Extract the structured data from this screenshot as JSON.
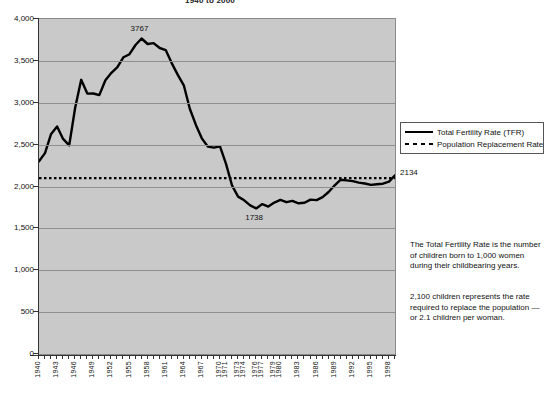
{
  "title": "1940 to 2000",
  "legend": {
    "items": [
      {
        "label": "Total Fertility Rate (TFR)",
        "style": "solid",
        "color": "#000000"
      },
      {
        "label": "Population Replacement Rate",
        "style": "dashed",
        "color": "#000000"
      }
    ]
  },
  "notes": {
    "note1": "The Total Fertility Rate is the number of children born to 1,000 women during their childbearing years.",
    "note2": "2,100 children represents the rate required to replace the population — or 2.1 children per woman."
  },
  "labels": {
    "peak": "3767",
    "trough": "1738",
    "end": "2134"
  },
  "chart_data": {
    "type": "line",
    "title": "1940 to 2000",
    "xlabel": "",
    "ylabel": "",
    "ylim": [
      0,
      4000
    ],
    "yticks": [
      0,
      500,
      1000,
      1500,
      2000,
      2500,
      3000,
      3500,
      4000
    ],
    "ytick_labels": [
      "0",
      "500",
      "1,000",
      "1,500",
      "2,000",
      "2,500",
      "3,000",
      "3,500",
      "4,000"
    ],
    "xlim": [
      1940,
      1999
    ],
    "xtick_labels": [
      "1940",
      "1943",
      "1946",
      "1949",
      "1952",
      "1955",
      "1958",
      "1961",
      "1964",
      "1967",
      "1970",
      "1971",
      "1973",
      "1974",
      "1976",
      "1977",
      "1979",
      "1980",
      "1983",
      "1986",
      "1989",
      "1992",
      "1995",
      "1998"
    ],
    "grid": true,
    "legend_position": "right",
    "plot_background": "#c9c9c9",
    "annotations": [
      {
        "text": "3767",
        "x": 1957,
        "y": 3767
      },
      {
        "text": "1738",
        "x": 1976,
        "y": 1738
      },
      {
        "text": "2134",
        "x": 1999,
        "y": 2134
      }
    ],
    "series": [
      {
        "name": "Total Fertility Rate (TFR)",
        "style": "solid",
        "x": [
          1940,
          1941,
          1942,
          1943,
          1944,
          1945,
          1946,
          1947,
          1948,
          1949,
          1950,
          1951,
          1952,
          1953,
          1954,
          1955,
          1956,
          1957,
          1958,
          1959,
          1960,
          1961,
          1962,
          1963,
          1964,
          1965,
          1966,
          1967,
          1968,
          1969,
          1970,
          1971,
          1972,
          1973,
          1974,
          1975,
          1976,
          1977,
          1978,
          1979,
          1980,
          1981,
          1982,
          1983,
          1984,
          1985,
          1986,
          1987,
          1988,
          1989,
          1990,
          1991,
          1992,
          1993,
          1994,
          1995,
          1996,
          1997,
          1998,
          1999
        ],
        "values": [
          2301,
          2399,
          2628,
          2718,
          2568,
          2491,
          2943,
          3274,
          3109,
          3110,
          3091,
          3269,
          3358,
          3424,
          3544,
          3580,
          3689,
          3767,
          3701,
          3712,
          3654,
          3629,
          3474,
          3333,
          3208,
          2928,
          2736,
          2573,
          2477,
          2465,
          2480,
          2267,
          2010,
          1879,
          1835,
          1774,
          1738,
          1790,
          1760,
          1808,
          1840,
          1812,
          1828,
          1799,
          1807,
          1844,
          1838,
          1872,
          1934,
          2014,
          2081,
          2073,
          2065,
          2046,
          2036,
          2019,
          2027,
          2033,
          2059,
          2134
        ]
      },
      {
        "name": "Population Replacement Rate",
        "style": "dashed",
        "x": [
          1940,
          1999
        ],
        "values": [
          2100,
          2100
        ]
      }
    ]
  }
}
